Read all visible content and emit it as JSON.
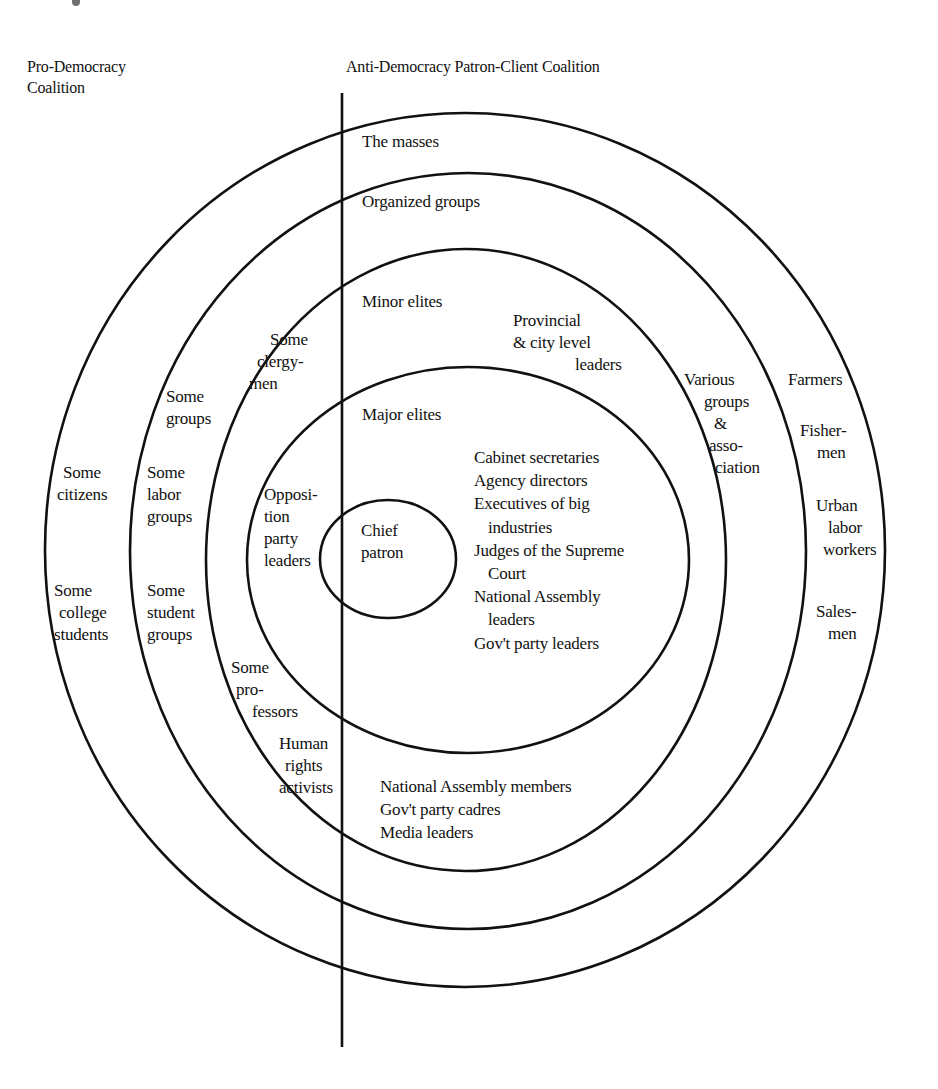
{
  "headers": {
    "pro_democracy": [
      "Pro-Democracy",
      "Coalition"
    ],
    "anti_democracy": "Anti-Democracy Patron-Client Coalition"
  },
  "rings": {
    "outer": {
      "name": "The masses",
      "right_side": [
        "Farmers",
        "Fisher-|men",
        "Urban|labor|workers",
        "Sales-|men"
      ],
      "left_side": [
        "Some|citizens",
        "Some|college|students"
      ]
    },
    "organized": {
      "name": "Organized groups",
      "right_side": [
        "Various|groups|&|asso-|ciation"
      ],
      "left_side": [
        "Some|groups",
        "Some|labor|groups",
        "Some|student|groups"
      ]
    },
    "minor_elites": {
      "name": "Minor elites",
      "right_side": [
        "Provincial|& city level|leaders"
      ],
      "left_side": [
        "Some|clergy-|men",
        "Some|pro-|fessors",
        "Human|rights|activists"
      ],
      "bottom": [
        "National Assembly members",
        "Gov't party cadres",
        "Media leaders"
      ]
    },
    "major_elites": {
      "name": "Major elites",
      "right_side": [
        "Cabinet secretaries",
        "Agency directors",
        "Executives of big",
        "industries",
        "Judges of the Supreme",
        "Court",
        "National Assembly",
        "leaders",
        "Gov't party leaders"
      ],
      "left_side": [
        "Opposi-|tion|party|leaders"
      ]
    },
    "core": {
      "name": [
        "Chief",
        "patron"
      ]
    }
  },
  "labels": {
    "the_masses": "The masses",
    "organized_groups": "Organized groups",
    "minor_elites": "Minor elites",
    "major_elites": "Major elites",
    "chief_patron": [
      "Chief",
      "patron"
    ],
    "provincial": [
      "Provincial",
      "& city level",
      "leaders"
    ],
    "various_groups": [
      "Various",
      "groups",
      "&",
      "asso-",
      "ciation"
    ],
    "farmers": "Farmers",
    "fishermen": [
      "Fisher-",
      "men"
    ],
    "urban_labor": [
      "Urban",
      "labor",
      "workers"
    ],
    "salesmen": [
      "Sales-",
      "men"
    ],
    "some_citizens": [
      "Some",
      "citizens"
    ],
    "some_college_students": [
      "Some",
      "college",
      "students"
    ],
    "some_groups": [
      "Some",
      "groups"
    ],
    "some_labor_groups": [
      "Some",
      "labor",
      "groups"
    ],
    "some_student_groups": [
      "Some",
      "student",
      "groups"
    ],
    "some_clergymen": [
      "Some",
      "clergy-",
      "men"
    ],
    "opposition_party_leaders": [
      "Opposi-",
      "tion",
      "party",
      "leaders"
    ],
    "some_professors": [
      "Some",
      "pro-",
      "fessors"
    ],
    "human_rights_activists": [
      "Human",
      "rights",
      "activists"
    ],
    "major_elite_members": [
      "Cabinet secretaries",
      "Agency directors",
      "Executives of big",
      "industries",
      "Judges of the Supreme",
      "Court",
      "National Assembly",
      "leaders",
      "Gov't party leaders"
    ],
    "minor_elite_members": [
      "National Assembly members",
      "Gov't party cadres",
      "Media leaders"
    ]
  },
  "colors": {
    "ink": "#111111",
    "background": "#ffffff"
  }
}
